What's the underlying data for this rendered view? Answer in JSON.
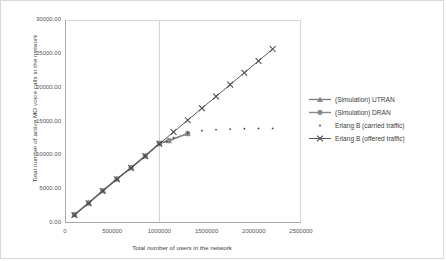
{
  "chart_data": {
    "type": "line",
    "title": "",
    "xlabel": "Total number of users in the network",
    "ylabel": "Total number of active MO voice calls in the network",
    "xlim": [
      0,
      2500000
    ],
    "ylim": [
      0,
      30000
    ],
    "xticks": [
      "0",
      "500000",
      "1000000",
      "1500000",
      "2000000",
      "2500000"
    ],
    "xtick_values": [
      0,
      500000,
      1000000,
      1500000,
      2000000,
      2500000
    ],
    "yticks": [
      "0.00",
      "5000.00",
      "10000.00",
      "15000.00",
      "20000.00",
      "25000.00",
      "30000.00"
    ],
    "ytick_values": [
      0,
      5000,
      10000,
      15000,
      20000,
      25000,
      30000
    ],
    "grid": "vertical-gridline-at-1000000",
    "legend_position": "right",
    "series": [
      {
        "name": "(Simulation) UTRAN",
        "marker": "triangle",
        "line": true,
        "color": "#808080",
        "points": [
          [
            100000,
            1200
          ],
          [
            250000,
            2950
          ],
          [
            400000,
            4750
          ],
          [
            550000,
            6500
          ],
          [
            700000,
            8150
          ],
          [
            850000,
            9900
          ],
          [
            1000000,
            11750
          ],
          [
            1100000,
            12150
          ],
          [
            1300000,
            13200
          ]
        ]
      },
      {
        "name": "(Simulation) DRAN",
        "marker": "circle",
        "line": true,
        "color": "#888888",
        "points": [
          [
            100000,
            1230
          ],
          [
            250000,
            2980
          ],
          [
            400000,
            4780
          ],
          [
            550000,
            6520
          ],
          [
            700000,
            8180
          ],
          [
            850000,
            9930
          ],
          [
            1000000,
            11800
          ],
          [
            1100000,
            12200
          ],
          [
            1300000,
            13250
          ]
        ]
      },
      {
        "name": "Erlang B (carried traffic)",
        "marker": "dot",
        "line": false,
        "color": "#4a4a4a",
        "points": [
          [
            100000,
            1150
          ],
          [
            250000,
            2900
          ],
          [
            400000,
            4700
          ],
          [
            550000,
            6450
          ],
          [
            700000,
            8100
          ],
          [
            850000,
            9850
          ],
          [
            1000000,
            11600
          ],
          [
            1075000,
            12050
          ],
          [
            1150000,
            12600
          ],
          [
            1300000,
            13300
          ],
          [
            1450000,
            13650
          ],
          [
            1600000,
            13800
          ],
          [
            1750000,
            13880
          ],
          [
            1900000,
            13930
          ],
          [
            2050000,
            13960
          ],
          [
            2200000,
            13980
          ]
        ]
      },
      {
        "name": "Erlang B (offered traffic)",
        "marker": "x",
        "line": true,
        "color": "#4a4a4a",
        "points": [
          [
            100000,
            1180
          ],
          [
            250000,
            2930
          ],
          [
            400000,
            4730
          ],
          [
            550000,
            6480
          ],
          [
            700000,
            8130
          ],
          [
            850000,
            9880
          ],
          [
            1000000,
            11700
          ],
          [
            1150000,
            13450
          ],
          [
            1300000,
            15200
          ],
          [
            1450000,
            16950
          ],
          [
            1600000,
            18700
          ],
          [
            1750000,
            20450
          ],
          [
            1900000,
            22200
          ],
          [
            2050000,
            23950
          ],
          [
            2200000,
            25700
          ]
        ]
      }
    ]
  },
  "axes": {
    "y_title": "Total number of active MO voice calls in the network",
    "x_title": "Total number of users in the network"
  }
}
